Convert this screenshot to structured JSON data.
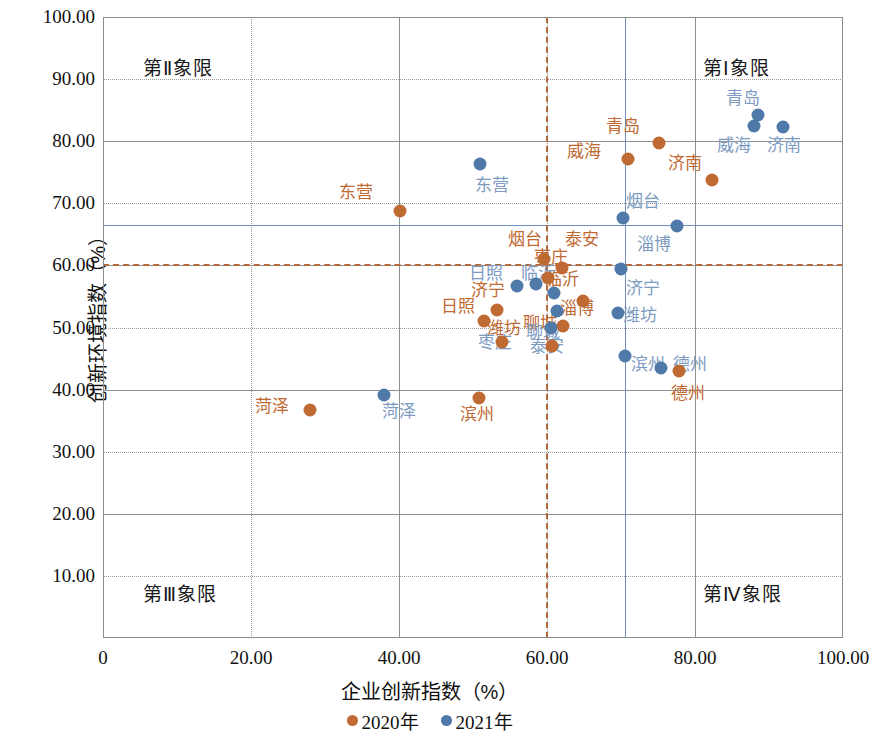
{
  "chart_data": {
    "type": "scatter",
    "title": "",
    "xlabel": "企业创新指数（%）",
    "ylabel": "创新环境指数（%）",
    "xlim": [
      0,
      100
    ],
    "ylim": [
      0,
      100
    ],
    "xticks": [
      "0",
      "20.00",
      "40.00",
      "60.00",
      "80.00",
      "100.00"
    ],
    "xtick_values": [
      0,
      20,
      40,
      60,
      80,
      100
    ],
    "yticks": [
      "10.00",
      "20.00",
      "30.00",
      "40.00",
      "50.00",
      "60.00",
      "70.00",
      "80.00",
      "90.00",
      "100.00"
    ],
    "ytick_values": [
      10,
      20,
      30,
      40,
      50,
      60,
      70,
      80,
      90,
      100
    ],
    "grid": true,
    "legend_position": "bottom",
    "legend": [
      {
        "name": "2020年",
        "color": "#bf6a33"
      },
      {
        "name": "2021年",
        "color": "#4f79a8"
      }
    ],
    "reference_lines": {
      "x_2020": 59.9,
      "x_2021": 70.5,
      "y_2020": 60.2,
      "y_2021": 66.5,
      "color_2020": "#b5693a",
      "color_2021": "#6a8fc0"
    },
    "quadrant_labels": [
      {
        "text": "第Ⅱ象限",
        "quadrant": "II"
      },
      {
        "text": "第Ⅰ象限",
        "quadrant": "I"
      },
      {
        "text": "第Ⅲ象限",
        "quadrant": "III"
      },
      {
        "text": "第Ⅳ象限",
        "quadrant": "IV"
      }
    ],
    "series": [
      {
        "name": "2020年",
        "color": "#bf6a33",
        "points": [
          {
            "label": "东营",
            "x": 40.1,
            "y": 68.7,
            "lx": 34.2,
            "ly": 71.8
          },
          {
            "label": "青岛",
            "x": 75.2,
            "y": 79.7,
            "lx": 70.3,
            "ly": 82.5
          },
          {
            "label": "威海",
            "x": 71.0,
            "y": 77.2,
            "lx": 65.0,
            "ly": 78.5
          },
          {
            "label": "济南",
            "x": 82.3,
            "y": 73.7,
            "lx": 78.6,
            "ly": 76.5
          },
          {
            "label": "烟台",
            "x": 59.6,
            "y": 61.0,
            "lx": 57.0,
            "ly": 64.3
          },
          {
            "label": "泰安",
            "x": 62.0,
            "y": 59.6,
            "lx": 64.7,
            "ly": 64.3
          },
          {
            "label": "枣庄",
            "x": 60.2,
            "y": 58.0,
            "lx": 60.5,
            "ly": 61.3
          },
          {
            "label": "临沂",
            "x": 64.8,
            "y": 54.3,
            "lx": 62.0,
            "ly": 57.8
          },
          {
            "label": "济宁",
            "x": 53.2,
            "y": 52.8,
            "lx": 52.0,
            "ly": 56.0
          },
          {
            "label": "日照",
            "x": 51.5,
            "y": 51.1,
            "lx": 48.0,
            "ly": 53.5
          },
          {
            "label": "淄博",
            "x": 62.2,
            "y": 50.3,
            "lx": 64.0,
            "ly": 53.2
          },
          {
            "label": "潍坊",
            "x": 53.9,
            "y": 47.6,
            "lx": 54.2,
            "ly": 50.0
          },
          {
            "label": "聊城",
            "x": 60.7,
            "y": 47.0,
            "lx": 59.0,
            "ly": 50.7
          },
          {
            "label": "德州",
            "x": 77.8,
            "y": 43.0,
            "lx": 79.0,
            "ly": 39.5
          },
          {
            "label": "菏泽",
            "x": 28.0,
            "y": 36.7,
            "lx": 22.8,
            "ly": 37.4
          },
          {
            "label": "滨州",
            "x": 50.8,
            "y": 38.7,
            "lx": 50.5,
            "ly": 36.1
          }
        ]
      },
      {
        "name": "2021年",
        "color": "#4f79a8",
        "points": [
          {
            "label": "青岛",
            "x": 88.5,
            "y": 84.2,
            "lx": 86.5,
            "ly": 87.0
          },
          {
            "label": "威海",
            "x": 88.0,
            "y": 82.4,
            "lx": 85.3,
            "ly": 79.4
          },
          {
            "label": "济南",
            "x": 91.9,
            "y": 82.3,
            "lx": 92.0,
            "ly": 79.4
          },
          {
            "label": "东营",
            "x": 50.9,
            "y": 76.3,
            "lx": 52.5,
            "ly": 73.0
          },
          {
            "label": "烟台",
            "x": 70.3,
            "y": 67.6,
            "lx": 73.0,
            "ly": 70.4
          },
          {
            "label": "淄博",
            "x": 77.5,
            "y": 66.3,
            "lx": 74.5,
            "ly": 63.5
          },
          {
            "label": "济宁",
            "x": 70.0,
            "y": 59.4,
            "lx": 73.0,
            "ly": 56.4
          },
          {
            "label": "日照",
            "x": 56.0,
            "y": 56.7,
            "lx": 51.8,
            "ly": 58.8
          },
          {
            "label": "临沂",
            "x": 61.0,
            "y": 55.6,
            "lx": 58.8,
            "ly": 58.8
          },
          {
            "label": "潍坊",
            "x": 69.6,
            "y": 52.3,
            "lx": 72.6,
            "ly": 52.0
          },
          {
            "label": "聊城",
            "x": 61.3,
            "y": 52.6,
            "lx": 59.4,
            "ly": 49.3
          },
          {
            "label": "泰安",
            "x": 60.6,
            "y": 50.0,
            "lx": 60.0,
            "ly": 47.0
          },
          {
            "label": "滨州",
            "x": 70.5,
            "y": 45.4,
            "lx": 73.7,
            "ly": 44.2
          },
          {
            "label": "德州",
            "x": 75.4,
            "y": 43.4,
            "lx": 79.3,
            "ly": 44.2
          },
          {
            "label": "菏泽",
            "x": 38.0,
            "y": 39.1,
            "lx": 40.0,
            "ly": 36.6
          },
          {
            "label": "枣庄",
            "x": 58.5,
            "y": 57.0,
            "lx": 53.0,
            "ly": 47.6
          }
        ]
      }
    ]
  }
}
